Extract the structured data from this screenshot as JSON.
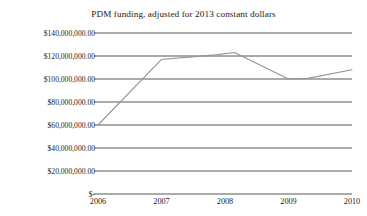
{
  "chart_data": {
    "type": "line",
    "title": "PDM funding, adjusted for 2013 constant dollars",
    "xlabel": "",
    "ylabel": "",
    "categories": [
      "2006",
      "2007",
      "2008",
      "2009",
      "2010"
    ],
    "x": [
      2006,
      2007,
      2008,
      2009,
      2010
    ],
    "values": [
      60000000,
      117000000,
      122000000,
      100000000,
      108000000
    ],
    "vertices": [
      {
        "x": 2006.0,
        "y": 60000000
      },
      {
        "x": 2007.0,
        "y": 117000000
      },
      {
        "x": 2007.85,
        "y": 121000000
      },
      {
        "x": 2008.15,
        "y": 123000000
      },
      {
        "x": 2009.0,
        "y": 100000000
      },
      {
        "x": 2009.3,
        "y": 100500000
      },
      {
        "x": 2010.0,
        "y": 108000000
      }
    ],
    "ylim": [
      0,
      140000000
    ],
    "ytick_values": [
      0,
      20000000,
      40000000,
      60000000,
      80000000,
      100000000,
      120000000,
      140000000
    ],
    "ytick_labels": [
      "$-",
      "$20,000,000.00",
      "$40,000,000.00",
      "$60,000,000.00",
      "$80,000,000.00",
      "$100,000,000.00",
      "$120,000,000.00",
      "$140,000,000.00"
    ],
    "xtick_labels": [
      "2006",
      "2007",
      "2008",
      "2009",
      "2010"
    ],
    "grid": true,
    "grid_axis": "y",
    "legend": false,
    "legend_position": "none",
    "series": [
      {
        "name": "PDM funding",
        "color": "#969696",
        "values": [
          60000000,
          117000000,
          122000000,
          100000000,
          108000000
        ]
      }
    ],
    "colors": {
      "line": "#969696",
      "grid": "#2b2b2b",
      "text": "#1a1a1a",
      "background": "#ffffff"
    }
  }
}
